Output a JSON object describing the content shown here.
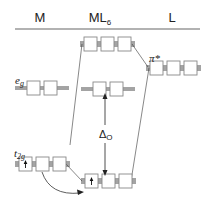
{
  "headers": {
    "metal": "M",
    "complex_main": "ML",
    "complex_sub": "6",
    "ligand": "L"
  },
  "labels": {
    "eg_main": "e",
    "eg_sub": "g",
    "t2g_main": "t",
    "t2g_sub": "2g",
    "pi_star": "π*",
    "delta_main": "Δ",
    "delta_sub": "O"
  },
  "levels": [
    {
      "id": "metal-eg",
      "column": "M",
      "orbitals": 2,
      "electrons": [
        0,
        0
      ]
    },
    {
      "id": "metal-t2g",
      "column": "M",
      "orbitals": 3,
      "electrons": [
        1,
        0,
        0
      ]
    },
    {
      "id": "complex-upper",
      "column": "ML6",
      "orbitals": 3,
      "electrons": [
        0,
        0,
        0
      ]
    },
    {
      "id": "complex-eg",
      "column": "ML6",
      "orbitals": 2,
      "electrons": [
        0,
        0
      ]
    },
    {
      "id": "complex-t2g",
      "column": "ML6",
      "orbitals": 3,
      "electrons": [
        1,
        0,
        0
      ]
    },
    {
      "id": "ligand-pi-star",
      "column": "L",
      "orbitals": 3,
      "electrons": [
        0,
        0,
        0
      ]
    }
  ],
  "colors": {
    "line": "#333333",
    "box_fill": "#ffffff",
    "box_stroke": "#888888",
    "rule": "#999999"
  }
}
